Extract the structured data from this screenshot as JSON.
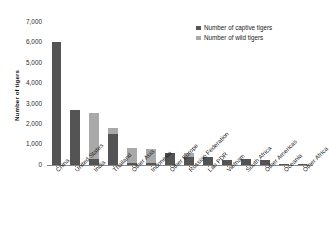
{
  "chart_data": {
    "type": "bar",
    "subtype": "stacked-bar",
    "title": "",
    "xlabel": "",
    "ylabel": "Number of tigers",
    "ylim": [
      0,
      7000
    ],
    "ytick_labels": [
      "7,000",
      "6,000",
      "5,000",
      "4,000",
      "3,000",
      "2,000",
      "1,000",
      "0"
    ],
    "ytick_values": [
      7000,
      6000,
      5000,
      4000,
      3000,
      2000,
      1000,
      0
    ],
    "grid": false,
    "legend_position": "top-right",
    "categories": [
      "China",
      "United States",
      "India",
      "Thailand",
      "Other Asia",
      "Indonesia",
      "Other Europe",
      "Russian Federation",
      "Lao PDR",
      "Vietnam",
      "South Africa",
      "Other Americas",
      "Oceania",
      "Other Africa"
    ],
    "series": [
      {
        "name": "Number of captive tigers",
        "color": "#545454",
        "values": [
          6000,
          2700,
          300,
          1500,
          100,
          80,
          600,
          400,
          380,
          250,
          280,
          230,
          60,
          40
        ]
      },
      {
        "name": "Number of wild tigers",
        "color": "#a9a9a9",
        "values": [
          0,
          0,
          2250,
          300,
          750,
          700,
          0,
          200,
          0,
          0,
          0,
          0,
          0,
          0
        ]
      }
    ]
  },
  "legend": {
    "items": [
      {
        "label": "Number of captive tigers",
        "color": "#545454"
      },
      {
        "label": "Number of wild tigers",
        "color": "#a9a9a9"
      }
    ]
  },
  "axes": {
    "y_title": "Number of tigers"
  }
}
